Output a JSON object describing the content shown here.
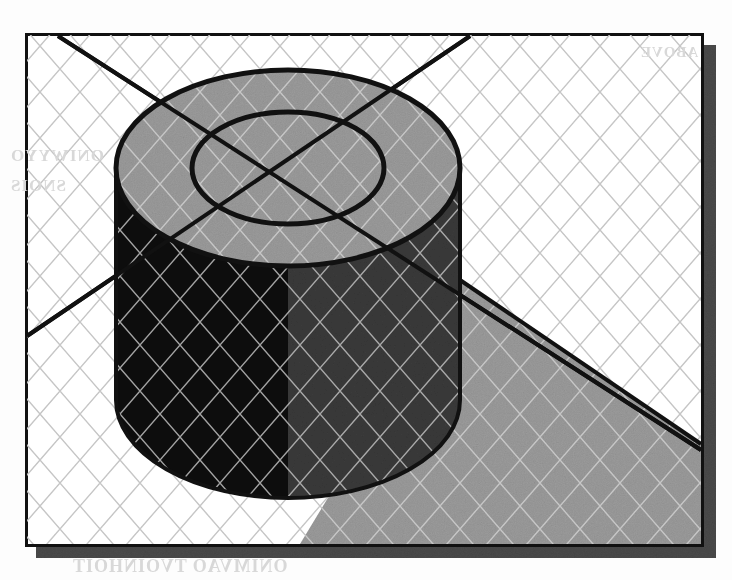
{
  "document": {
    "kind": "scanned-technical-illustration",
    "title": "Isometric cylinder with central bore on gridded ground plane",
    "caption": ""
  },
  "canvas": {
    "width": 732,
    "height": 580,
    "background": "#fdfdfd"
  },
  "frame": {
    "x": 25,
    "y": 33,
    "width": 678,
    "height": 513,
    "border_color": "#111111",
    "border_width": 3,
    "fill": "#ffffff",
    "shadow_offset_x": 11,
    "shadow_offset_y": 12,
    "shadow_color": "#4a4a4a"
  },
  "palette": {
    "ink": "#111111",
    "paper": "#ffffff",
    "grid_line": "#c9c9c9",
    "top_face": "#9b9b9b",
    "body_dark": "#0d0d0d",
    "body_mid": "#3a3a3a",
    "cast_shadow": "#9b9b9b",
    "frame_shadow": "#4a4a4a",
    "bleed_text": "#d8d8d8"
  },
  "grid": {
    "type": "isometric-diamond",
    "spacing": 46,
    "angle_degrees": 30,
    "line_color": "#c9c9c9",
    "line_width": 1.4
  },
  "cylinder": {
    "center_x": 288,
    "center_y": 168,
    "outer_radius_x": 172,
    "outer_radius_y": 98,
    "inner_radius_x": 96,
    "inner_radius_y": 56,
    "height": 232,
    "top_face_color": "#9b9b9b",
    "left_body_color": "#0d0d0d",
    "right_body_color": "#3a3a3a",
    "outline_color": "#111111",
    "outline_width": 4
  },
  "cast_shadow": {
    "color": "#9b9b9b",
    "edge_color": "#111111",
    "edge_width": 3,
    "points": "460,280 703,444 703,546 300,546"
  },
  "axis_lines": [
    {
      "name": "axis-line-major",
      "x1": 58,
      "y1": 36,
      "x2": 703,
      "y2": 450,
      "color": "#111111",
      "width": 4
    },
    {
      "name": "axis-line-minor",
      "x1": 27,
      "y1": 335,
      "x2": 470,
      "y2": 36,
      "color": "#111111",
      "width": 4
    }
  ],
  "scan_artifacts": {
    "bleed_left_line1": "ONIWYYO",
    "bleed_left_line2": "SNOIS",
    "bleed_bottom": "ONIMVAO TVOINHOIT",
    "bleed_top": "ABOVE"
  }
}
